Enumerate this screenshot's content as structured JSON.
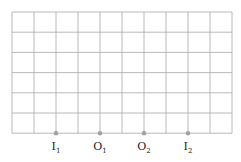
{
  "diagram": {
    "grid": {
      "left": 12,
      "top": 12,
      "cols": 10,
      "rows": 6,
      "cell_w": 22,
      "cell_h": 20.2,
      "line_color": "#a8a8a8"
    },
    "point_color": "#a0a0a0",
    "points": [
      {
        "label": "I",
        "sub": "1",
        "col": 2
      },
      {
        "label": "O",
        "sub": "1",
        "col": 4
      },
      {
        "label": "O",
        "sub": "2",
        "col": 6
      },
      {
        "label": "I",
        "sub": "2",
        "col": 8
      }
    ]
  }
}
